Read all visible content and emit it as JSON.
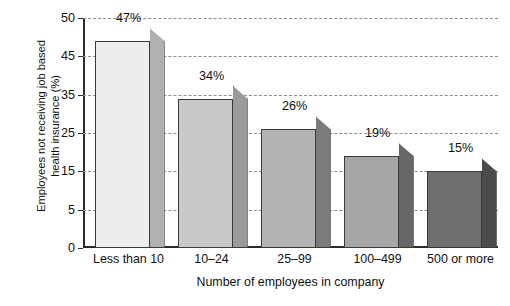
{
  "chart_data": {
    "type": "bar",
    "title": "",
    "categories": [
      "Less than 10",
      "10–24",
      "25–99",
      "100–499",
      "500 or more"
    ],
    "values": [
      47,
      34,
      26,
      19,
      15
    ],
    "data_labels": [
      "47%",
      "34%",
      "26%",
      "19%",
      "15%"
    ],
    "xlabel": "Number of employees in company",
    "ylabel_line1": "Employees not receiving job based",
    "ylabel_line2": "health insurance (%)",
    "ylabel": "Employees not receiving job based health insurance (%)",
    "ytick_labels": [
      "50",
      "45",
      "35",
      "25",
      "15",
      "5",
      "0"
    ],
    "ytick_values": [
      50,
      45,
      35,
      25,
      15,
      5,
      0
    ],
    "ylim": [
      0,
      50
    ],
    "grid": "horizontal-dashed",
    "legend": "none",
    "style": "3d-shaded-bars",
    "series": [
      {
        "name": "Employees not receiving job based health insurance (%)",
        "values": [
          47,
          34,
          26,
          19,
          15
        ]
      }
    ],
    "bar_colors_front": [
      "#ededed",
      "#c9c9c9",
      "#b4b4b4",
      "#a6a6a6",
      "#6f6f6f"
    ],
    "bar_colors_side": [
      "#b0b0b0",
      "#9a9a9a",
      "#7b7b7b",
      "#666666",
      "#4b4b4b"
    ],
    "axis_color": "#2b2b2b",
    "grid_color": "#8d8d8d"
  },
  "caption": {
    "fragment": ""
  }
}
